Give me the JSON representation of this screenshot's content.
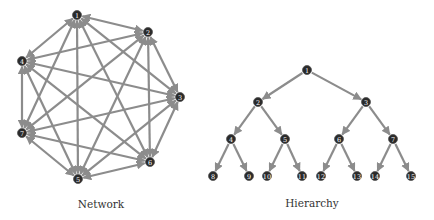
{
  "network": {
    "caption": "Network",
    "nodes": [
      {
        "id": "1",
        "x": 77,
        "y": 15
      },
      {
        "id": "2",
        "x": 148,
        "y": 32
      },
      {
        "id": "3",
        "x": 180,
        "y": 97
      },
      {
        "id": "4",
        "x": 22,
        "y": 61
      },
      {
        "id": "5",
        "x": 78,
        "y": 179
      },
      {
        "id": "6",
        "x": 150,
        "y": 162
      },
      {
        "id": "7",
        "x": 22,
        "y": 133
      }
    ],
    "edges": "all-pairs-bidirectional"
  },
  "hierarchy": {
    "caption": "Hierarchy",
    "nodes": [
      {
        "id": "1",
        "x": 307,
        "y": 70
      },
      {
        "id": "2",
        "x": 258,
        "y": 102
      },
      {
        "id": "3",
        "x": 366,
        "y": 102
      },
      {
        "id": "4",
        "x": 231,
        "y": 139
      },
      {
        "id": "5",
        "x": 285,
        "y": 139
      },
      {
        "id": "6",
        "x": 339,
        "y": 139
      },
      {
        "id": "7",
        "x": 393,
        "y": 139
      },
      {
        "id": "8",
        "x": 213,
        "y": 176
      },
      {
        "id": "9",
        "x": 249,
        "y": 176
      },
      {
        "id": "10",
        "x": 267,
        "y": 176
      },
      {
        "id": "11",
        "x": 302,
        "y": 176
      },
      {
        "id": "12",
        "x": 321,
        "y": 176
      },
      {
        "id": "13",
        "x": 357,
        "y": 176
      },
      {
        "id": "14",
        "x": 375,
        "y": 176
      },
      {
        "id": "15",
        "x": 411,
        "y": 176
      }
    ],
    "edges": [
      [
        "1",
        "2"
      ],
      [
        "1",
        "3"
      ],
      [
        "2",
        "4"
      ],
      [
        "2",
        "5"
      ],
      [
        "3",
        "6"
      ],
      [
        "3",
        "7"
      ],
      [
        "4",
        "8"
      ],
      [
        "4",
        "9"
      ],
      [
        "5",
        "10"
      ],
      [
        "5",
        "11"
      ],
      [
        "6",
        "12"
      ],
      [
        "6",
        "13"
      ],
      [
        "7",
        "14"
      ],
      [
        "7",
        "15"
      ]
    ]
  },
  "style": {
    "node_color": "#2a2a2a",
    "edge_color": "#8c8c8c"
  }
}
